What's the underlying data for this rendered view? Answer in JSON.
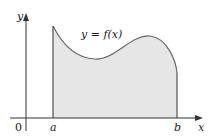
{
  "figure": {
    "curve_label": "y = f(x)",
    "y_axis_label": "y",
    "x_axis_label": "x",
    "origin_label": "0",
    "lower_limit_label": "a",
    "upper_limit_label": "b"
  },
  "colors": {
    "fill": "#e6e6e6",
    "curve": "#6a6a6a",
    "axes": "#333333"
  }
}
